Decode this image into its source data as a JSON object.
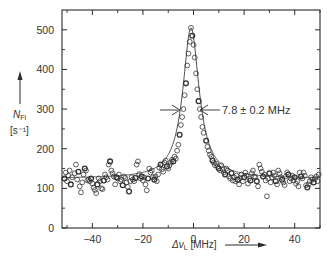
{
  "chart_data": {
    "type": "scatter",
    "title": "",
    "xlabel": "Δν_L [MHz]",
    "ylabel": "N_Fl",
    "ylabel_units": "[s⁻¹]",
    "xlim": [
      -52,
      50
    ],
    "ylim": [
      0,
      550
    ],
    "xticks": [
      -40,
      -20,
      0,
      20,
      40
    ],
    "xtick_labels": [
      "−40",
      "−20",
      "0",
      "20",
      "40"
    ],
    "xminor_ticks": [
      -50,
      -30,
      -10,
      10,
      30,
      50
    ],
    "yticks": [
      0,
      100,
      200,
      300,
      400,
      500
    ],
    "ytick_labels": [
      "0",
      "100",
      "200",
      "300",
      "400",
      "500"
    ],
    "yminor_ticks": [
      50,
      150,
      250,
      350,
      450
    ],
    "grid": false,
    "legend": null,
    "annotation": {
      "text": "7.8 ± 0.2 MHz",
      "meaning": "FWHM linewidth",
      "y_level": 300,
      "left_arrow_x": -5,
      "right_arrow_x": 3
    },
    "fit_curve": {
      "type": "lorentzian",
      "center": -1,
      "fwhm": 7.8,
      "baseline": 125,
      "peak": 505
    },
    "series": [
      {
        "name": "measured fluorescence rate",
        "marker": "open-circle",
        "points": [
          [
            -51,
            125
          ],
          [
            -50.5,
            140
          ],
          [
            -50,
            118
          ],
          [
            -49.5,
            132
          ],
          [
            -49,
            145
          ],
          [
            -48.5,
            110
          ],
          [
            -48,
            128
          ],
          [
            -47,
            138
          ],
          [
            -46.5,
            160
          ],
          [
            -46,
            122
          ],
          [
            -45.5,
            142
          ],
          [
            -45,
            105
          ],
          [
            -44.5,
            90
          ],
          [
            -44,
            115
          ],
          [
            -43.5,
            135
          ],
          [
            -43,
            150
          ],
          [
            -42.5,
            145
          ],
          [
            -42,
            120
          ],
          [
            -41.5,
            122
          ],
          [
            -41,
            118
          ],
          [
            -40.5,
            125
          ],
          [
            -40,
            112
          ],
          [
            -39.5,
            102
          ],
          [
            -39,
            96
          ],
          [
            -38.5,
            88
          ],
          [
            -38,
            110
          ],
          [
            -37.5,
            125
          ],
          [
            -37,
            118
          ],
          [
            -36.5,
            100
          ],
          [
            -36,
            98
          ],
          [
            -35.5,
            120
          ],
          [
            -35,
            135
          ],
          [
            -34.5,
            128
          ],
          [
            -34,
            122
          ],
          [
            -33.5,
            160
          ],
          [
            -33,
            168
          ],
          [
            -32.5,
            145
          ],
          [
            -32,
            138
          ],
          [
            -31.5,
            130
          ],
          [
            -31,
            110
          ],
          [
            -30.5,
            128
          ],
          [
            -30,
            125
          ],
          [
            -29.5,
            135
          ],
          [
            -29,
            118
          ],
          [
            -28.5,
            122
          ],
          [
            -28,
            108
          ],
          [
            -27.5,
            130
          ],
          [
            -27,
            126
          ],
          [
            -26.5,
            115
          ],
          [
            -26,
            104
          ],
          [
            -25.5,
            92
          ],
          [
            -25,
            118
          ],
          [
            -24.5,
            128
          ],
          [
            -24,
            122
          ],
          [
            -23.5,
            118
          ],
          [
            -23,
            126
          ],
          [
            -22.5,
            160
          ],
          [
            -22,
            168
          ],
          [
            -21.5,
            136
          ],
          [
            -21,
            125
          ],
          [
            -20.5,
            130
          ],
          [
            -20,
            120
          ],
          [
            -19.5,
            128
          ],
          [
            -19,
            110
          ],
          [
            -18.5,
            95
          ],
          [
            -18,
            125
          ],
          [
            -17.5,
            150
          ],
          [
            -17,
            140
          ],
          [
            -16.5,
            145
          ],
          [
            -16,
            128
          ],
          [
            -15.5,
            122
          ],
          [
            -15,
            130
          ],
          [
            -14.5,
            118
          ],
          [
            -14,
            135
          ],
          [
            -13.5,
            152
          ],
          [
            -13,
            160
          ],
          [
            -12.5,
            148
          ],
          [
            -12,
            142
          ],
          [
            -11.5,
            165
          ],
          [
            -11,
            170
          ],
          [
            -10.5,
            155
          ],
          [
            -10,
            150
          ],
          [
            -9.5,
            158
          ],
          [
            -9,
            165
          ],
          [
            -8.5,
            172
          ],
          [
            -8,
            168
          ],
          [
            -7.5,
            180
          ],
          [
            -7,
            175
          ],
          [
            -6.5,
            195
          ],
          [
            -6,
            210
          ],
          [
            -5.5,
            235
          ],
          [
            -5,
            260
          ],
          [
            -4.5,
            280
          ],
          [
            -4,
            300
          ],
          [
            -3.5,
            335
          ],
          [
            -3,
            365
          ],
          [
            -2.5,
            410
          ],
          [
            -2,
            440
          ],
          [
            -1.5,
            470
          ],
          [
            -1,
            505
          ],
          [
            -0.5,
            485
          ],
          [
            0,
            462
          ],
          [
            0.5,
            430
          ],
          [
            1,
            390
          ],
          [
            1.5,
            350
          ],
          [
            2,
            320
          ],
          [
            2.5,
            300
          ],
          [
            3,
            280
          ],
          [
            3.5,
            255
          ],
          [
            4,
            240
          ],
          [
            5,
            220
          ],
          [
            5.5,
            205
          ],
          [
            6,
            195
          ],
          [
            6.5,
            185
          ],
          [
            7,
            180
          ],
          [
            7.5,
            170
          ],
          [
            8,
            165
          ],
          [
            8.5,
            158
          ],
          [
            9,
            162
          ],
          [
            9.5,
            155
          ],
          [
            10,
            150
          ],
          [
            10.5,
            145
          ],
          [
            11,
            158
          ],
          [
            11.5,
            148
          ],
          [
            12,
            140
          ],
          [
            12.5,
            135
          ],
          [
            13,
            150
          ],
          [
            13.5,
            145
          ],
          [
            14,
            130
          ],
          [
            14.5,
            125
          ],
          [
            15,
            138
          ],
          [
            15.5,
            120
          ],
          [
            16,
            128
          ],
          [
            16.5,
            118
          ],
          [
            17,
            132
          ],
          [
            17.5,
            122
          ],
          [
            18,
            110
          ],
          [
            18.5,
            126
          ],
          [
            19,
            135
          ],
          [
            19.5,
            118
          ],
          [
            20,
            128
          ],
          [
            20.5,
            140
          ],
          [
            21,
            132
          ],
          [
            21.5,
            112
          ],
          [
            22,
            125
          ],
          [
            22.5,
            120
          ],
          [
            23,
            138
          ],
          [
            23.5,
            145
          ],
          [
            24,
            130
          ],
          [
            24.5,
            128
          ],
          [
            25,
            118
          ],
          [
            25.5,
            105
          ],
          [
            26,
            160
          ],
          [
            26.5,
            150
          ],
          [
            27,
            142
          ],
          [
            27.5,
            130
          ],
          [
            28,
            135
          ],
          [
            28.5,
            120
          ],
          [
            29,
            80
          ],
          [
            29.5,
            125
          ],
          [
            30,
            138
          ],
          [
            30.5,
            115
          ],
          [
            31,
            128
          ],
          [
            31.5,
            140
          ],
          [
            32,
            132
          ],
          [
            32.5,
            118
          ],
          [
            33,
            110
          ],
          [
            33.5,
            145
          ],
          [
            34,
            138
          ],
          [
            34.5,
            128
          ],
          [
            35,
            122
          ],
          [
            35.5,
            115
          ],
          [
            36,
            108
          ],
          [
            36.5,
            130
          ],
          [
            37,
            140
          ],
          [
            37.5,
            135
          ],
          [
            38,
            118
          ],
          [
            38.5,
            125
          ],
          [
            39,
            132
          ],
          [
            39.5,
            120
          ],
          [
            40,
            128
          ],
          [
            40.5,
            112
          ],
          [
            41,
            118
          ],
          [
            41.5,
            105
          ],
          [
            42,
            140
          ],
          [
            42.5,
            130
          ],
          [
            43,
            125
          ],
          [
            43.5,
            140
          ],
          [
            44,
            132
          ],
          [
            44.5,
            108
          ],
          [
            45,
            102
          ],
          [
            45.5,
            110
          ],
          [
            46,
            118
          ],
          [
            46.5,
            128
          ],
          [
            47,
            122
          ],
          [
            47.5,
            115
          ],
          [
            48,
            125
          ],
          [
            48.5,
            130
          ],
          [
            49,
            118
          ],
          [
            49.5,
            135
          ]
        ]
      }
    ]
  },
  "colors": {
    "ink": "#2a2a2a",
    "background": "#ffffff",
    "marker_stroke": "#333333"
  }
}
